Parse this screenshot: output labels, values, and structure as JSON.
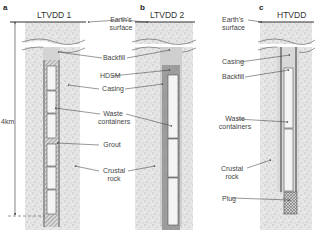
{
  "panels": [
    {
      "letter": "a",
      "title": "LTVDD 1"
    },
    {
      "letter": "b",
      "title": "LTVDD 2"
    },
    {
      "letter": "c",
      "title": "HTVDD"
    }
  ],
  "depth_label": "4km",
  "labels_ab": {
    "earth_surface_1": "Earth's",
    "earth_surface_2": "surface",
    "backfill": "Backfill",
    "hdsm": "HDSM",
    "casing": "Casing",
    "waste_1": "Waste",
    "waste_2": "containers",
    "grout": "Grout",
    "crustal_1": "Crustal",
    "crustal_2": "rock"
  },
  "labels_c": {
    "earth_surface_1": "Earth's",
    "earth_surface_2": "surface",
    "casing": "Casing",
    "backfill": "Backfill",
    "waste_1": "Waste",
    "waste_2": "containers",
    "crustal_1": "Crustal",
    "crustal_2": "rock",
    "plug": "Plug"
  },
  "colors": {
    "rock": "#e4e4e4",
    "casing": "#9a9a9a",
    "hdsm": "#8c8c8c",
    "container": "#f4f4f4",
    "line": "#333333"
  }
}
